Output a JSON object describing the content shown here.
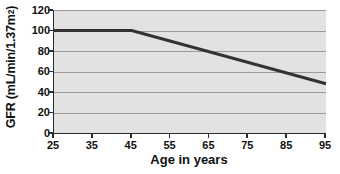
{
  "chart_data": {
    "type": "line",
    "title": "",
    "xlabel": "Age in years",
    "ylabel": "GFR (mL/min/1.37m²)",
    "ylabel_main": "GFR (mL/min/1.37m",
    "ylabel_exponent": "2",
    "ylabel_close": ")",
    "xlim": [
      25,
      95
    ],
    "ylim": [
      0,
      120
    ],
    "xticks": [
      25,
      35,
      45,
      55,
      65,
      75,
      85,
      95
    ],
    "yticks": [
      0,
      20,
      40,
      60,
      80,
      100,
      120
    ],
    "gridlines_y": [
      20,
      40,
      60,
      80,
      100,
      120
    ],
    "grid": true,
    "legend": "none",
    "plot_background": "#e2e2e2",
    "gridline_color": "#9a9a9a",
    "axis_color": "#2b2b2b",
    "series": [
      {
        "name": "GFR decline with age",
        "color": "#333333",
        "line_width": 3,
        "x": [
          25,
          45,
          95
        ],
        "values": [
          100,
          100,
          48
        ]
      }
    ]
  }
}
